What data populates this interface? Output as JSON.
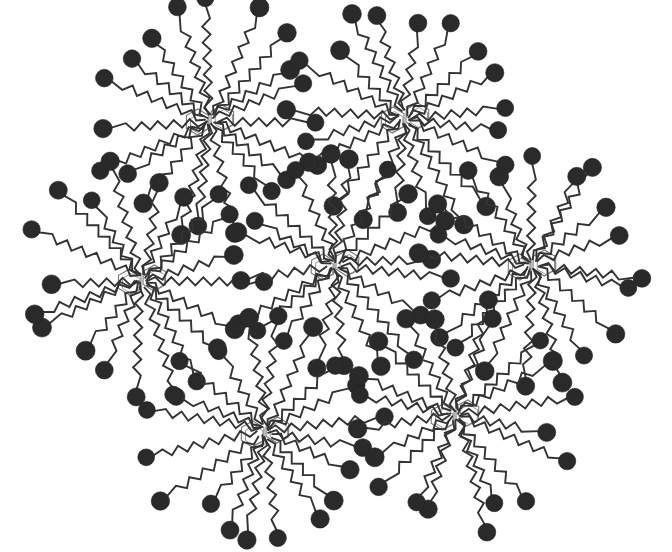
{
  "diagram": {
    "title": "",
    "colors": {
      "background": "#ffffff",
      "chain": "#333333",
      "head": "#2a2a2a",
      "core_ring": "#777777"
    },
    "molecule_params": {
      "arm_count": 20,
      "arm_length_min": 78,
      "arm_length_max": 112,
      "zigzag_segment": 8,
      "zigzag_amplitude": 4,
      "head_radius": 9,
      "ring_radius": 13
    },
    "molecules": [
      {
        "id": "top-left",
        "cx": 210,
        "cy": 120,
        "rotation": 0,
        "seed": 1
      },
      {
        "id": "top-right",
        "cx": 405,
        "cy": 118,
        "rotation": 8,
        "seed": 2
      },
      {
        "id": "middle-left",
        "cx": 142,
        "cy": 280,
        "rotation": 4,
        "seed": 3
      },
      {
        "id": "center",
        "cx": 335,
        "cy": 265,
        "rotation": 12,
        "seed": 4
      },
      {
        "id": "middle-right",
        "cx": 532,
        "cy": 265,
        "rotation": 2,
        "seed": 5
      },
      {
        "id": "bottom-left",
        "cx": 265,
        "cy": 432,
        "rotation": 6,
        "seed": 6
      },
      {
        "id": "bottom-right",
        "cx": 455,
        "cy": 415,
        "rotation": 10,
        "seed": 7
      }
    ]
  }
}
